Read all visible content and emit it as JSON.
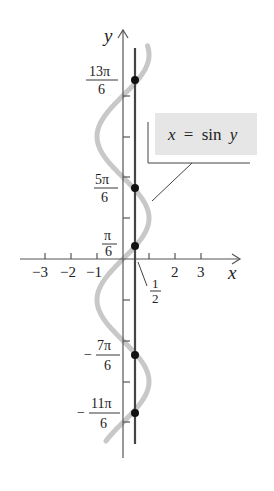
{
  "diagram": {
    "equation_label": "x = sin y",
    "equation_parts": {
      "lhs": "x",
      "eq": "=",
      "fn": "sin",
      "var": "y"
    },
    "axes": {
      "x_label": "x",
      "y_label": "y",
      "x_ticks": [
        {
          "value": -3,
          "label": "−3"
        },
        {
          "value": -2,
          "label": "−2"
        },
        {
          "value": -1,
          "label": "−1"
        },
        {
          "value": 1,
          "label": ""
        },
        {
          "value": 2,
          "label": "2"
        },
        {
          "value": 3,
          "label": "3"
        }
      ],
      "y_ticks_multiples_of_pi_over_2": [
        -4,
        -3,
        -2,
        -1,
        1,
        2,
        3,
        4
      ]
    },
    "vertical_line": {
      "x": 0.5,
      "label_num": "1",
      "label_den": "2"
    },
    "points": [
      {
        "y_label_num": "13π",
        "y_label_den": "6",
        "sign": "",
        "value": "13π/6"
      },
      {
        "y_label_num": "5π",
        "y_label_den": "6",
        "sign": "",
        "value": "5π/6"
      },
      {
        "y_label_num": "π",
        "y_label_den": "6",
        "sign": "",
        "value": "π/6"
      },
      {
        "y_label_num": "7π",
        "y_label_den": "6",
        "sign": "−",
        "value": "−7π/6"
      },
      {
        "y_label_num": "11π",
        "y_label_den": "6",
        "sign": "−",
        "value": "−11π/6"
      }
    ],
    "colors": {
      "curve": "#c8c8c8",
      "axis": "#555555",
      "line": "#444444",
      "dot": "#111111",
      "callout_fill": "#e6e6e6"
    }
  }
}
